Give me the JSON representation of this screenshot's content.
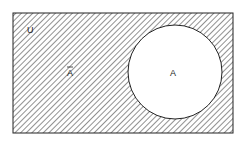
{
  "diagram": {
    "type": "venn",
    "universe_label": "U",
    "set_label": "A",
    "complement_label": "A",
    "complement_bar": true,
    "shaded_region": "complement of A",
    "colors": {
      "stroke": "#222222",
      "hatch": "#555555",
      "background": "#ffffff"
    }
  }
}
